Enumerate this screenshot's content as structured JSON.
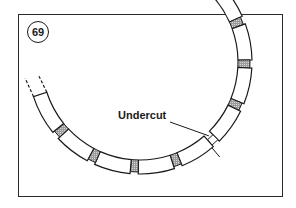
{
  "figure": {
    "number": "69",
    "callout_label": "Undercut"
  },
  "geometry": {
    "center": [
      140,
      62
    ],
    "inner_radius": 98,
    "outer_radius": 112,
    "start_angle_deg": -68,
    "end_angle_deg": 162,
    "segment_count": 10,
    "separator_width_deg": 4.2,
    "undercut_segment_index": 4
  },
  "colors": {
    "line": "#1a1a1a",
    "mica_fill": "#9a9a9a",
    "frame": "#2a2a2a"
  }
}
